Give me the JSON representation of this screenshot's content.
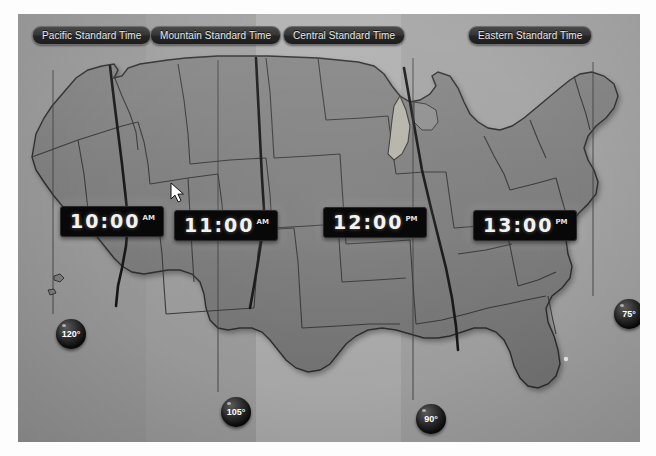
{
  "map": {
    "background_color": "#9a9a9a",
    "land_color": "#7d7d7d",
    "border_color": "#2b2b2b",
    "frame_color": "#ffffff"
  },
  "timezones": [
    {
      "id": "pacific",
      "label": "Pacific Standard Time",
      "band_color": "#989898"
    },
    {
      "id": "mountain",
      "label": "Mountain Standard Time",
      "band_color": "#9d9d9d"
    },
    {
      "id": "central",
      "label": "Central Standard Time",
      "band_color": "#adadad"
    },
    {
      "id": "eastern",
      "label": "Eastern Standard Time",
      "band_color": "#a2a2a2"
    }
  ],
  "clocks": [
    {
      "id": "pacific-clock",
      "time": "10:00",
      "meridiem": "AM"
    },
    {
      "id": "mountain-clock",
      "time": "11:00",
      "meridiem": "AM"
    },
    {
      "id": "central-clock",
      "time": "12:00",
      "meridiem": "PM"
    },
    {
      "id": "eastern-clock",
      "time": "13:00",
      "meridiem": "PM"
    }
  ],
  "meridians": [
    {
      "id": "m120",
      "label": "120°"
    },
    {
      "id": "m105",
      "label": "105°"
    },
    {
      "id": "m90",
      "label": "90°"
    },
    {
      "id": "m75",
      "label": "75°"
    }
  ],
  "cursor": {
    "icon": "mouse-pointer-icon",
    "color": "#ffffff"
  }
}
